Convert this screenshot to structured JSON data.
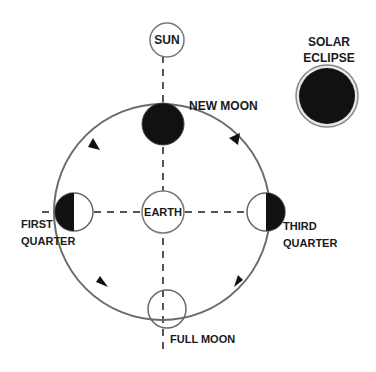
{
  "diagram": {
    "colors": {
      "line": "#6b6b6b",
      "fill_dark": "#111111",
      "text": "#1a1a1a",
      "background": "#ffffff"
    },
    "bodies": {
      "sun": {
        "label": "SUN"
      },
      "earth": {
        "label": "EARTH"
      }
    },
    "moon_phases": [
      {
        "id": "new-moon",
        "label": "NEW MOON"
      },
      {
        "id": "first-quarter",
        "label_line1": "FIRST",
        "label_line2": "QUARTER"
      },
      {
        "id": "third-quarter",
        "label_line1": "THIRD",
        "label_line2": "QUARTER"
      },
      {
        "id": "full-moon",
        "label": "FULL MOON"
      }
    ],
    "eclipse": {
      "label_line1": "SOLAR",
      "label_line2": "ECLIPSE"
    },
    "orbit": {
      "direction": "counter-clockwise",
      "arrow_icons": [
        "arrow-icon",
        "arrow-icon",
        "arrow-icon",
        "arrow-icon"
      ]
    }
  }
}
